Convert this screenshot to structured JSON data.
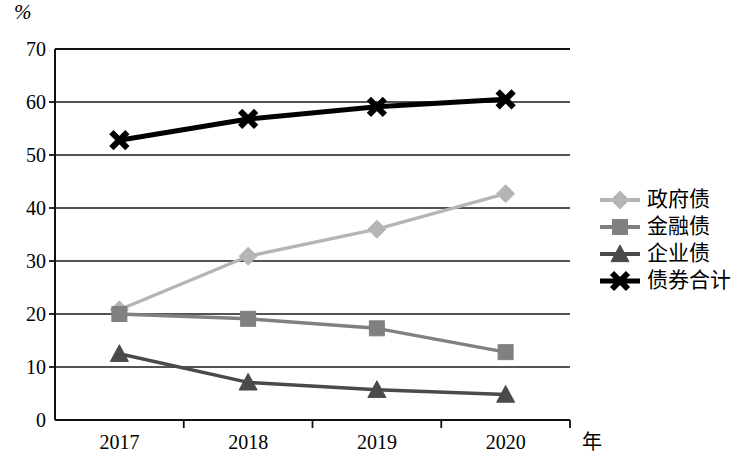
{
  "chart_data": {
    "type": "line",
    "title": "",
    "subtitle": "",
    "xlabel": "年",
    "ylabel": "%",
    "categories": [
      "2017",
      "2018",
      "2019",
      "2020"
    ],
    "ylim": [
      0,
      70
    ],
    "ytick_step": 10,
    "yticks": [
      "0",
      "10",
      "20",
      "30",
      "40",
      "50",
      "60",
      "70"
    ],
    "grid": "horizontal",
    "legend_position": "right",
    "series": [
      {
        "name": "政府债",
        "values": [
          20.8,
          30.9,
          36.0,
          42.7
        ],
        "color": "#b5b5b5",
        "marker": "diamond"
      },
      {
        "name": "金融债",
        "values": [
          20.0,
          19.1,
          17.3,
          12.8
        ],
        "color": "#808080",
        "marker": "square"
      },
      {
        "name": "企业债",
        "values": [
          12.5,
          7.1,
          5.7,
          4.8
        ],
        "color": "#4a4a4a",
        "marker": "triangle"
      },
      {
        "name": "债券合计",
        "values": [
          52.8,
          56.8,
          59.1,
          60.5
        ],
        "color": "#000000",
        "marker": "cross-x"
      }
    ]
  },
  "axis": {
    "unit_label": "%",
    "x_axis_title": "年",
    "y_tick_labels": [
      "70",
      "60",
      "50",
      "40",
      "30",
      "20",
      "10",
      "0"
    ],
    "x_tick_labels": [
      "2017",
      "2018",
      "2019",
      "2020"
    ]
  },
  "legend": {
    "items": [
      {
        "label": "政府债",
        "color": "#b5b5b5",
        "marker": "diamond-marker-icon"
      },
      {
        "label": "金融债",
        "color": "#808080",
        "marker": "square-marker-icon"
      },
      {
        "label": "企业债",
        "color": "#4a4a4a",
        "marker": "triangle-marker-icon"
      },
      {
        "label": "债券合计",
        "color": "#000000",
        "marker": "x-marker-icon"
      }
    ]
  }
}
